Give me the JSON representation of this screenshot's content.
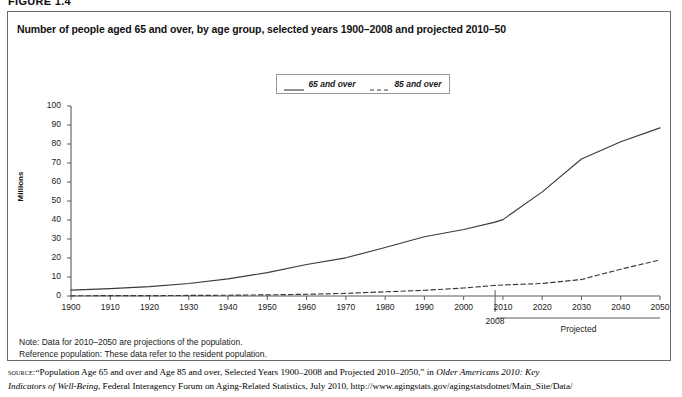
{
  "figure": {
    "label": "FIGURE 1.4",
    "title": "Number of people aged 65 and over, by age group, selected years 1900–2008 and projected 2010–50"
  },
  "legend": {
    "items": [
      {
        "label": "65 and over",
        "style": "solid"
      },
      {
        "label": "85 and over",
        "style": "dashed"
      }
    ]
  },
  "axes": {
    "y_title": "Millions",
    "y_ticks": [
      "0",
      "10",
      "20",
      "30",
      "40",
      "50",
      "60",
      "70",
      "80",
      "90",
      "100"
    ],
    "x_ticks": [
      "1900",
      "1910",
      "1920",
      "1930",
      "1940",
      "1950",
      "1960",
      "1970",
      "1980",
      "1990",
      "2000",
      "2010",
      "2020",
      "2030",
      "2040",
      "2050"
    ],
    "marker_2008": "2008",
    "projected_label": "Projected"
  },
  "notes": {
    "line1": "Note: Data for 2010–2050 are projections of the population.",
    "line2": "Reference population: These data refer to the resident population."
  },
  "source": {
    "kicker": "source:",
    "text_1": "“Population Age 65 and over and Age 85 and over, Selected Years 1900–2008 and Projected 2010–2050,” in ",
    "italic_1": "Older Americans 2010: Key",
    "italic_2": "Indicators of Well-Being",
    "text_2": ", Federal Interagency Forum on Aging-Related Statistics, July 2010, http://www.agingstats.gov/agingstatsdotnet/Main_Site/Data/"
  },
  "colors": {
    "line": "#3a3a3a",
    "axis": "#5a5a5a",
    "border": "#6b6b6b",
    "text": "#111111",
    "background": "#ffffff"
  },
  "chart_data": {
    "type": "line",
    "title": "Number of people aged 65 and over, by age group, selected years 1900–2008 and projected 2010–50",
    "xlabel": "",
    "ylabel": "Millions",
    "xlim": [
      1900,
      2050
    ],
    "ylim": [
      0,
      100
    ],
    "grid": false,
    "legend_position": "top-center",
    "x": [
      1900,
      1910,
      1920,
      1930,
      1940,
      1950,
      1960,
      1970,
      1980,
      1990,
      2000,
      2008,
      2010,
      2020,
      2030,
      2040,
      2050
    ],
    "series": [
      {
        "name": "65 and over",
        "style": "solid",
        "values": [
          3.1,
          3.9,
          4.9,
          6.6,
          9.0,
          12.3,
          16.6,
          20.1,
          25.5,
          31.2,
          35.0,
          38.9,
          40.2,
          54.8,
          72.1,
          81.2,
          88.5
        ]
      },
      {
        "name": "85 and over",
        "style": "dashed",
        "values": [
          0.1,
          0.2,
          0.2,
          0.3,
          0.4,
          0.6,
          0.9,
          1.4,
          2.2,
          3.0,
          4.2,
          5.6,
          5.8,
          6.6,
          8.7,
          14.1,
          19.0
        ]
      }
    ],
    "annotations": [
      {
        "text": "2008",
        "x": 2008,
        "type": "x-axis-marker"
      },
      {
        "text": "Projected",
        "x_range": [
          2010,
          2050
        ],
        "type": "x-axis-bracket"
      }
    ]
  }
}
